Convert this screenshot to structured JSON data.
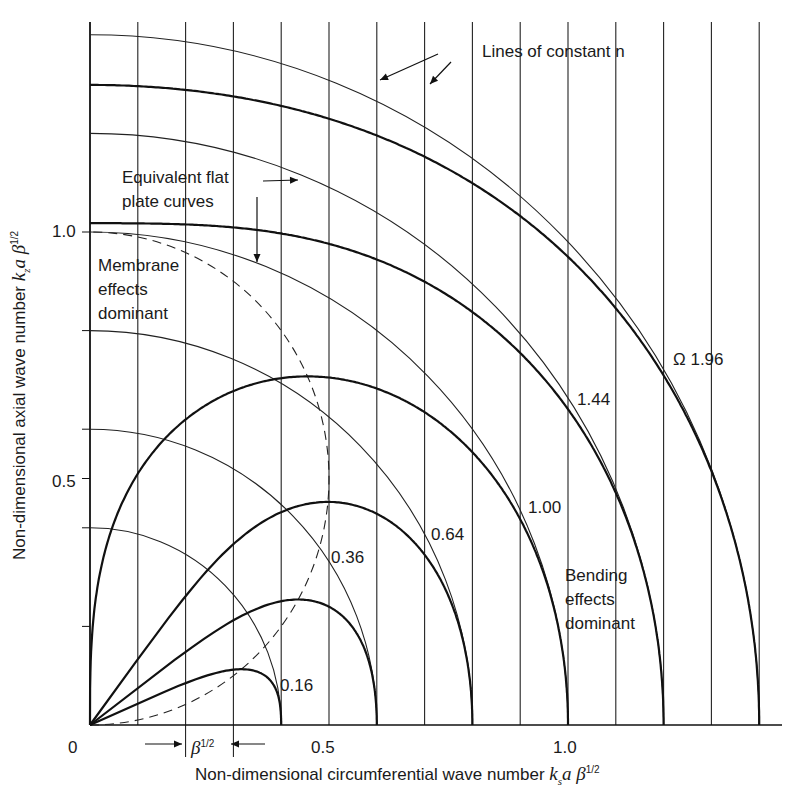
{
  "chart_data": {
    "type": "line",
    "title": "",
    "xlabel": "Non-dimensional circumferential wave number k_s a β^1/2",
    "ylabel": "Non-dimensional axial wave number k_z a β^1/2",
    "xlim": [
      0,
      1.45
    ],
    "ylim": [
      0,
      1.43
    ],
    "x_ticks": [
      {
        "value": 0,
        "label": "0"
      },
      {
        "value": 0.5,
        "label": "0.5"
      },
      {
        "value": 1.0,
        "label": "1.0"
      }
    ],
    "y_ticks": [
      {
        "value": 0.5,
        "label": "0.5"
      },
      {
        "value": 1.0,
        "label": "1.0"
      }
    ],
    "constant_n_lines_x": [
      0.0,
      0.1,
      0.2,
      0.3,
      0.4,
      0.5,
      0.6,
      0.7,
      0.8,
      0.9,
      1.0,
      1.1,
      1.2,
      1.3,
      1.4
    ],
    "flat_plate_curves": {
      "description": "Equivalent flat plate curves (quarter circles)",
      "radii": [
        0.4,
        0.6,
        0.8,
        1.0,
        1.2,
        1.4
      ]
    },
    "series": [
      {
        "name": "Ω 0.16",
        "omega": 0.16,
        "x_intercept": 0.4,
        "peak_y": 0.11
      },
      {
        "name": "Ω 0.36",
        "omega": 0.36,
        "x_intercept": 0.6,
        "peak_y": 0.25
      },
      {
        "name": "Ω 0.64",
        "omega": 0.64,
        "x_intercept": 0.8,
        "peak_y": 0.45
      },
      {
        "name": "Ω 1.00",
        "omega": 1.0,
        "x_intercept": 1.0,
        "peak_y": 0.71
      },
      {
        "name": "Ω 1.44",
        "omega": 1.44,
        "x_intercept": 1.2,
        "y_intercept": 1.02
      },
      {
        "name": "Ω 1.96",
        "omega": 1.96,
        "x_intercept": 1.4,
        "y_intercept": 1.3
      }
    ],
    "boundary_curve": {
      "style": "dashed",
      "description": "membrane/bending boundary, circle through (0,0),(0.5,0.5),(0,1)"
    },
    "annotations": [
      "Lines of constant n",
      "Equivalent flat plate curves",
      "Membrane effects dominant",
      "Bending effects dominant",
      "β^1/2"
    ],
    "grid": false,
    "legend": "none"
  },
  "labels": {
    "lines_const_n": "Lines of constant n",
    "flat_plate_1": "Equivalent flat",
    "flat_plate_2": "plate curves",
    "membrane_1": "Membrane",
    "membrane_2": "effects",
    "membrane_3": "dominant",
    "bending_1": "Bending",
    "bending_2": "effects",
    "bending_3": "dominant",
    "omega_196": "Ω 1.96",
    "omega_144": "1.44",
    "omega_100": "1.00",
    "omega_064": "0.64",
    "omega_036": "0.36",
    "omega_016": "0.16",
    "x0": "0",
    "x05": "0.5",
    "x10": "1.0",
    "y05": "0.5",
    "y10": "1.0",
    "beta": "β",
    "half": "1/2",
    "xlabel_text": "Non-dimensional circumferential wave number ",
    "ylabel_text": "Non-dimensional axial wave number "
  }
}
